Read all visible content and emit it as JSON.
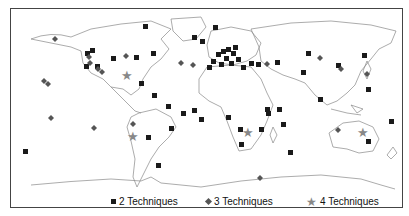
{
  "map": {
    "title": "",
    "legend": [
      {
        "symbol": "square",
        "label": "2 Techniques",
        "color": "#1a1a1a"
      },
      {
        "symbol": "diamond",
        "label": "3 Techniques",
        "color": "#555555"
      },
      {
        "symbol": "star",
        "label": "4 Techniques",
        "color": "#888888"
      }
    ],
    "markers": {
      "two": [
        [
          135,
          18
        ],
        [
          193,
          32
        ],
        [
          89,
          40
        ],
        [
          87,
          51
        ],
        [
          83,
          50
        ],
        [
          112,
          56
        ],
        [
          133,
          55
        ],
        [
          152,
          50
        ],
        [
          84,
          64
        ],
        [
          95,
          64
        ],
        [
          140,
          80
        ],
        [
          153,
          94
        ],
        [
          167,
          103
        ],
        [
          192,
          107
        ],
        [
          183,
          108
        ],
        [
          172,
          122
        ],
        [
          147,
          132
        ],
        [
          200,
          117
        ],
        [
          224,
          112
        ],
        [
          23,
          145
        ],
        [
          220,
          185
        ],
        [
          145,
          184
        ],
        [
          158,
          171
        ],
        [
          241,
          170
        ],
        [
          186,
          28
        ],
        [
          205,
          19
        ],
        [
          270,
          87
        ],
        [
          279,
          93
        ],
        [
          287,
          95
        ],
        [
          298,
          103
        ],
        [
          301,
          48
        ],
        [
          278,
          108
        ],
        [
          307,
          97
        ],
        [
          316,
          60
        ],
        [
          328,
          60
        ],
        [
          303,
          152
        ],
        [
          348,
          74
        ],
        [
          356,
          58
        ],
        [
          362,
          72
        ],
        [
          364,
          109
        ],
        [
          366,
          146
        ],
        [
          368,
          127
        ],
        [
          359,
          153
        ],
        [
          374,
          129
        ]
      ],
      "three": [
        [
          52,
          31
        ],
        [
          87,
          38
        ],
        [
          90,
          58
        ],
        [
          98,
          67
        ],
        [
          83,
          63
        ],
        [
          125,
          51
        ],
        [
          44,
          77
        ],
        [
          180,
          61
        ],
        [
          132,
          115
        ],
        [
          144,
          120
        ],
        [
          83,
          116
        ],
        [
          45,
          96
        ],
        [
          93,
          99
        ],
        [
          300,
          53
        ],
        [
          333,
          65
        ],
        [
          327,
          67
        ],
        [
          337,
          69
        ],
        [
          359,
          67
        ],
        [
          272,
          118
        ],
        [
          357,
          154
        ],
        [
          319,
          130
        ],
        [
          334,
          145
        ],
        [
          355,
          165
        ],
        [
          251,
          170
        ],
        [
          250,
          170
        ]
      ],
      "four": [
        [
          125,
          78
        ],
        [
          135,
          75
        ],
        [
          135,
          132
        ],
        [
          247,
          137
        ],
        [
          364,
          133
        ]
      ]
    },
    "stars_approx": "see markers.four"
  }
}
